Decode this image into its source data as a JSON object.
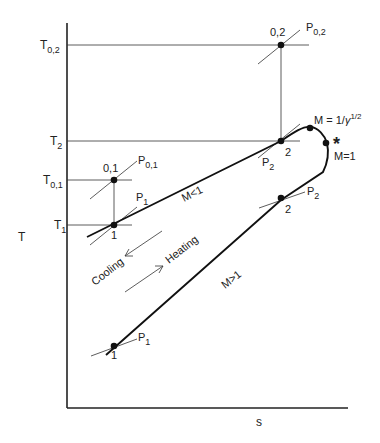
{
  "figure": {
    "type": "T-s diagram (Rayleigh line)",
    "colors": {
      "ink": "#222222",
      "background": "#ffffff"
    },
    "axes": {
      "ylabel": "T",
      "xlabel": "s",
      "ticks": [
        {
          "main": "T",
          "sub": "0,2",
          "y": 45
        },
        {
          "main": "T",
          "sub": "2",
          "y": 141
        },
        {
          "main": "T",
          "sub": "0,1",
          "y": 180
        },
        {
          "main": "T",
          "sub": "1",
          "y": 225
        }
      ]
    },
    "points": {
      "p01": {
        "label": "0,1",
        "isobar": "P",
        "isobar_sub": "0,1"
      },
      "p1_sub": {
        "label": "1",
        "isobar": "P",
        "isobar_sub": "1"
      },
      "p02": {
        "label": "0,2",
        "isobar": "P",
        "isobar_sub": "0,2"
      },
      "p2_sub": {
        "label": "2",
        "isobar": "P",
        "isobar_sub": "2"
      },
      "p2_sup": {
        "label": "2",
        "isobar": "P",
        "isobar_sub": "2"
      },
      "p1_sup": {
        "label": "1",
        "isobar": "P",
        "isobar_sub": "1"
      }
    },
    "annotations": {
      "max_T": {
        "prefix": "M = 1/",
        "gamma": "γ",
        "exp": "1/2"
      },
      "star": "*",
      "sonic": "M=1",
      "subsonic": "M<1",
      "supersonic": "M>1",
      "cooling": "Cooling",
      "heating": "Heating"
    }
  }
}
